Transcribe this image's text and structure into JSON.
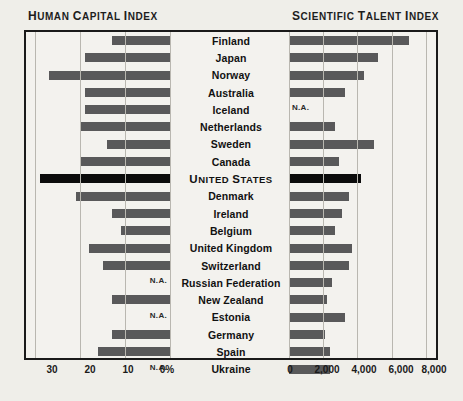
{
  "headers": {
    "left": "Human Capital Index",
    "right": "Scientific Talent Index"
  },
  "na_label": "N.A.",
  "colors": {
    "bar": "#59595a",
    "highlight_bar": "#0c0c0c",
    "background": "#efeee9",
    "panel": "#f3f2ee",
    "frame": "#1a1a1a",
    "gridline": "#b9b7b0",
    "text": "#1a1a1a"
  },
  "chart_data": {
    "type": "bar",
    "orientation": "horizontal",
    "layout": "butterfly",
    "grid": true,
    "legend": "none",
    "highlight_category": "United States",
    "categories": [
      "Finland",
      "Japan",
      "Norway",
      "Australia",
      "Iceland",
      "Netherlands",
      "Sweden",
      "Canada",
      "United States",
      "Denmark",
      "Ireland",
      "Belgium",
      "United Kingdom",
      "Switzerland",
      "Russian Federation",
      "New Zealand",
      "Estonia",
      "Germany",
      "Spain",
      "Ukraine"
    ],
    "panels": [
      {
        "name": "human_capital_index",
        "title": "Human Capital Index",
        "side": "left",
        "xlabel": "",
        "unit": "%",
        "xlim": [
          0,
          32
        ],
        "ticks": [
          30,
          20,
          10,
          0
        ],
        "tick_labels": [
          "30",
          "20",
          "10",
          "0%"
        ],
        "direction": "right-to-left",
        "values": [
          13,
          19,
          27,
          19,
          19,
          20,
          14,
          20,
          29,
          21,
          13,
          11,
          18,
          15,
          null,
          13,
          null,
          13,
          16,
          null
        ]
      },
      {
        "name": "scientific_talent_index",
        "title": "Scientific Talent Index",
        "side": "right",
        "xlabel": "",
        "unit": "",
        "xlim": [
          0,
          8600
        ],
        "ticks": [
          0,
          2000,
          4000,
          6000,
          8000
        ],
        "tick_labels": [
          "0",
          "2,000",
          "4,000",
          "6,000",
          "8,000"
        ],
        "direction": "left-to-right",
        "values": [
          7000,
          5200,
          4400,
          3300,
          null,
          2700,
          5000,
          2900,
          4200,
          3500,
          3100,
          2700,
          3700,
          3500,
          2500,
          2200,
          3300,
          2100,
          2400,
          2400
        ]
      }
    ]
  },
  "axis_left_ticks": [
    {
      "label": "30",
      "x": 52
    },
    {
      "label": "20",
      "x": 90
    },
    {
      "label": "10",
      "x": 128
    },
    {
      "label": "0%",
      "x": 167
    }
  ],
  "axis_right_ticks": [
    {
      "label": "0",
      "x": 290
    },
    {
      "label": "2,000",
      "x": 327
    },
    {
      "label": "4,000",
      "x": 364
    },
    {
      "label": "6,000",
      "x": 401
    },
    {
      "label": "8,000",
      "x": 434
    }
  ]
}
